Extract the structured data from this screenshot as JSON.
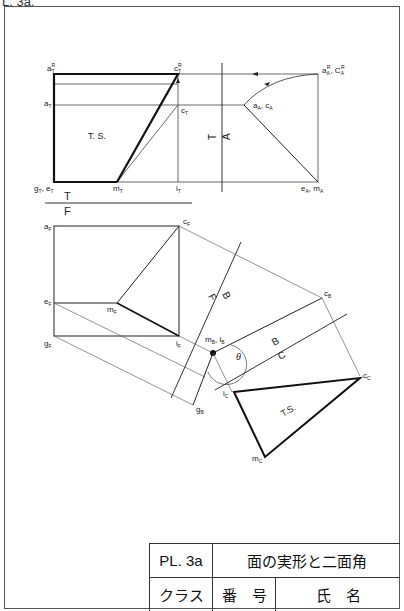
{
  "page_code": "L. 3a.",
  "drawing": {
    "top_view": {
      "labels": {
        "aT_R": "a",
        "aT_R_sub": "T",
        "aT_R_sup": "R",
        "cT_R": "c",
        "cT_R_sub": "T",
        "cT_R_sup": "R",
        "aT": "a",
        "aT_sub": "T",
        "cT": "c",
        "cT_sub": "T",
        "ts": "T. S.",
        "gT_eT": "g",
        "gT_eT_sub1": "T",
        "gT_eT_mid": ", e",
        "gT_eT_sub2": "T",
        "mT": "m",
        "mT_sub": "T",
        "iT": "i",
        "iT_sub": "T"
      }
    },
    "aux_view_A": {
      "fold_label_top": "T",
      "fold_label_bottom": "A",
      "labels": {
        "aA_R_cA_R": "a",
        "aA_R_sub": "A",
        "aA_R_sup": "R",
        "cA_R_mid": ", C",
        "cA_R_sub": "A",
        "cA_R_sup": "R",
        "aA_cA": "a",
        "aA_sub": "A",
        "aA_mid": ", c",
        "cA_sub": "A",
        "eA_mA": "e",
        "eA_sub": "A",
        "eA_mid": ", m",
        "mA_sub": "A"
      }
    },
    "fold_TF": {
      "top": "T",
      "bottom": "F"
    },
    "front_view": {
      "labels": {
        "aF": "a",
        "aF_sub": "F",
        "cF": "c",
        "cF_sub": "F",
        "eF": "e",
        "eF_sub": "F",
        "mF": "m",
        "mF_sub": "F",
        "gF": "g",
        "gF_sub": "F",
        "iF": "i",
        "iF_sub": "F"
      }
    },
    "fold_FB": {
      "top": "F",
      "bottom": "B"
    },
    "aux_view_B": {
      "labels": {
        "cB": "c",
        "cB_sub": "B",
        "mB_iB": "m",
        "mB_sub": "B",
        "mB_mid": ", i",
        "iB_sub": "B",
        "gB": "g",
        "gB_sub": "B",
        "theta": "θ"
      }
    },
    "fold_BC": {
      "top": "B",
      "bottom": "C"
    },
    "aux_view_C": {
      "labels": {
        "cC": "c",
        "cC_sub": "C",
        "iC": "i",
        "iC_sub": "C",
        "mC": "m",
        "mC_sub": "C",
        "ts": "T.S."
      }
    }
  },
  "title_block": {
    "plate": "PL. 3a",
    "title": "面の実形と二面角",
    "class_label": "クラス",
    "number_label": "番　号",
    "name_label": "氏　名"
  },
  "colors": {
    "line": "#1a1a1a",
    "thin_line": "#555555",
    "border": "#555555"
  }
}
